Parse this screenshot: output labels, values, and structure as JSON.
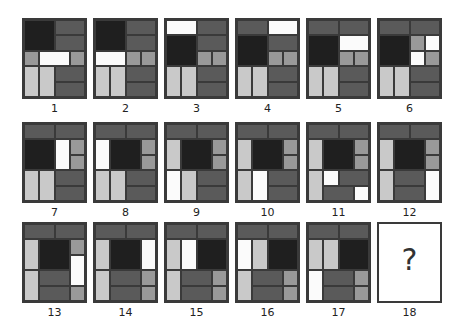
{
  "colors": {
    "K": "#1f1f1f",
    "D": "#5a5a5a",
    "M": "#999999",
    "L": "#c9c9c9",
    "W": "#fbfbfb"
  },
  "tiles": [
    {
      "label": "1",
      "cells": [
        [
          0,
          0,
          2,
          2,
          "K"
        ],
        [
          2,
          0,
          2,
          1,
          "D"
        ],
        [
          2,
          1,
          2,
          1,
          "D"
        ],
        [
          0,
          2,
          1,
          1,
          "M"
        ],
        [
          1,
          2,
          2,
          1,
          "W"
        ],
        [
          3,
          2,
          1,
          1,
          "M"
        ],
        [
          0,
          3,
          1,
          2,
          "L"
        ],
        [
          1,
          3,
          1,
          2,
          "L"
        ],
        [
          2,
          3,
          2,
          1,
          "D"
        ],
        [
          2,
          4,
          2,
          1,
          "D"
        ]
      ]
    },
    {
      "label": "2",
      "cells": [
        [
          0,
          0,
          2,
          2,
          "K"
        ],
        [
          2,
          0,
          2,
          1,
          "D"
        ],
        [
          2,
          1,
          2,
          1,
          "D"
        ],
        [
          0,
          2,
          2,
          1,
          "W"
        ],
        [
          2,
          2,
          1,
          1,
          "M"
        ],
        [
          3,
          2,
          1,
          1,
          "M"
        ],
        [
          0,
          3,
          1,
          2,
          "L"
        ],
        [
          1,
          3,
          1,
          2,
          "L"
        ],
        [
          2,
          3,
          2,
          1,
          "D"
        ],
        [
          2,
          4,
          2,
          1,
          "D"
        ]
      ]
    },
    {
      "label": "3",
      "cells": [
        [
          0,
          0,
          2,
          1,
          "W"
        ],
        [
          2,
          0,
          2,
          1,
          "D"
        ],
        [
          0,
          1,
          2,
          2,
          "K"
        ],
        [
          2,
          1,
          2,
          1,
          "D"
        ],
        [
          2,
          2,
          1,
          1,
          "M"
        ],
        [
          3,
          2,
          1,
          1,
          "M"
        ],
        [
          0,
          3,
          1,
          2,
          "L"
        ],
        [
          1,
          3,
          1,
          2,
          "L"
        ],
        [
          2,
          3,
          2,
          1,
          "D"
        ],
        [
          2,
          4,
          2,
          1,
          "D"
        ]
      ]
    },
    {
      "label": "4",
      "cells": [
        [
          0,
          0,
          2,
          1,
          "D"
        ],
        [
          2,
          0,
          2,
          1,
          "W"
        ],
        [
          0,
          1,
          2,
          2,
          "K"
        ],
        [
          2,
          1,
          2,
          1,
          "D"
        ],
        [
          2,
          2,
          1,
          1,
          "M"
        ],
        [
          3,
          2,
          1,
          1,
          "M"
        ],
        [
          0,
          3,
          1,
          2,
          "L"
        ],
        [
          1,
          3,
          1,
          2,
          "L"
        ],
        [
          2,
          3,
          2,
          1,
          "D"
        ],
        [
          2,
          4,
          2,
          1,
          "D"
        ]
      ]
    },
    {
      "label": "5",
      "cells": [
        [
          0,
          0,
          2,
          1,
          "D"
        ],
        [
          2,
          0,
          2,
          1,
          "D"
        ],
        [
          0,
          1,
          2,
          2,
          "K"
        ],
        [
          2,
          1,
          2,
          1,
          "W"
        ],
        [
          2,
          2,
          1,
          1,
          "M"
        ],
        [
          3,
          2,
          1,
          1,
          "M"
        ],
        [
          0,
          3,
          1,
          2,
          "L"
        ],
        [
          1,
          3,
          1,
          2,
          "L"
        ],
        [
          2,
          3,
          2,
          1,
          "D"
        ],
        [
          2,
          4,
          2,
          1,
          "D"
        ]
      ]
    },
    {
      "label": "6",
      "cells": [
        [
          0,
          0,
          2,
          1,
          "D"
        ],
        [
          2,
          0,
          2,
          1,
          "D"
        ],
        [
          0,
          1,
          2,
          2,
          "K"
        ],
        [
          2,
          1,
          1,
          1,
          "M"
        ],
        [
          3,
          1,
          1,
          1,
          "W"
        ],
        [
          2,
          2,
          1,
          1,
          "W"
        ],
        [
          3,
          2,
          1,
          1,
          "M"
        ],
        [
          0,
          3,
          1,
          2,
          "L"
        ],
        [
          1,
          3,
          1,
          2,
          "L"
        ],
        [
          2,
          3,
          2,
          1,
          "D"
        ],
        [
          2,
          4,
          2,
          1,
          "D"
        ]
      ]
    },
    {
      "label": "7",
      "cells": [
        [
          0,
          0,
          2,
          1,
          "D"
        ],
        [
          2,
          0,
          2,
          1,
          "D"
        ],
        [
          0,
          1,
          2,
          2,
          "K"
        ],
        [
          2,
          1,
          1,
          2,
          "W"
        ],
        [
          3,
          1,
          1,
          1,
          "M"
        ],
        [
          3,
          2,
          1,
          1,
          "M"
        ],
        [
          0,
          3,
          1,
          2,
          "L"
        ],
        [
          1,
          3,
          1,
          2,
          "L"
        ],
        [
          2,
          3,
          2,
          1,
          "D"
        ],
        [
          2,
          4,
          2,
          1,
          "D"
        ]
      ]
    },
    {
      "label": "8",
      "cells": [
        [
          0,
          0,
          2,
          1,
          "D"
        ],
        [
          2,
          0,
          2,
          1,
          "D"
        ],
        [
          0,
          1,
          1,
          2,
          "W"
        ],
        [
          1,
          1,
          2,
          2,
          "K"
        ],
        [
          3,
          1,
          1,
          1,
          "M"
        ],
        [
          3,
          2,
          1,
          1,
          "M"
        ],
        [
          0,
          3,
          1,
          2,
          "L"
        ],
        [
          1,
          3,
          1,
          2,
          "L"
        ],
        [
          2,
          3,
          2,
          1,
          "D"
        ],
        [
          2,
          4,
          2,
          1,
          "D"
        ]
      ]
    },
    {
      "label": "9",
      "cells": [
        [
          0,
          0,
          2,
          1,
          "D"
        ],
        [
          2,
          0,
          2,
          1,
          "D"
        ],
        [
          0,
          1,
          1,
          2,
          "L"
        ],
        [
          1,
          1,
          2,
          2,
          "K"
        ],
        [
          3,
          1,
          1,
          1,
          "M"
        ],
        [
          3,
          2,
          1,
          1,
          "M"
        ],
        [
          0,
          3,
          1,
          2,
          "W"
        ],
        [
          1,
          3,
          1,
          2,
          "L"
        ],
        [
          2,
          3,
          2,
          1,
          "D"
        ],
        [
          2,
          4,
          2,
          1,
          "D"
        ]
      ]
    },
    {
      "label": "10",
      "cells": [
        [
          0,
          0,
          2,
          1,
          "D"
        ],
        [
          2,
          0,
          2,
          1,
          "D"
        ],
        [
          0,
          1,
          1,
          2,
          "L"
        ],
        [
          1,
          1,
          2,
          2,
          "K"
        ],
        [
          3,
          1,
          1,
          1,
          "M"
        ],
        [
          3,
          2,
          1,
          1,
          "M"
        ],
        [
          0,
          3,
          1,
          2,
          "L"
        ],
        [
          1,
          3,
          1,
          2,
          "W"
        ],
        [
          2,
          3,
          2,
          1,
          "D"
        ],
        [
          2,
          4,
          2,
          1,
          "D"
        ]
      ]
    },
    {
      "label": "11",
      "cells": [
        [
          0,
          0,
          2,
          1,
          "D"
        ],
        [
          2,
          0,
          2,
          1,
          "D"
        ],
        [
          0,
          1,
          1,
          2,
          "L"
        ],
        [
          1,
          1,
          2,
          2,
          "K"
        ],
        [
          3,
          1,
          1,
          1,
          "M"
        ],
        [
          3,
          2,
          1,
          1,
          "M"
        ],
        [
          0,
          3,
          1,
          2,
          "L"
        ],
        [
          1,
          3,
          1,
          1,
          "W"
        ],
        [
          2,
          3,
          2,
          1,
          "D"
        ],
        [
          1,
          4,
          2,
          1,
          "D"
        ],
        [
          3,
          4,
          1,
          1,
          "W"
        ]
      ]
    },
    {
      "label": "12",
      "cells": [
        [
          0,
          0,
          2,
          1,
          "D"
        ],
        [
          2,
          0,
          2,
          1,
          "D"
        ],
        [
          0,
          1,
          1,
          2,
          "L"
        ],
        [
          1,
          1,
          2,
          2,
          "K"
        ],
        [
          3,
          1,
          1,
          1,
          "M"
        ],
        [
          3,
          2,
          1,
          1,
          "M"
        ],
        [
          0,
          3,
          1,
          2,
          "L"
        ],
        [
          1,
          3,
          2,
          1,
          "D"
        ],
        [
          1,
          4,
          2,
          1,
          "D"
        ],
        [
          3,
          3,
          1,
          2,
          "W"
        ]
      ]
    },
    {
      "label": "13",
      "cells": [
        [
          0,
          0,
          2,
          1,
          "D"
        ],
        [
          2,
          0,
          2,
          1,
          "D"
        ],
        [
          0,
          1,
          1,
          2,
          "L"
        ],
        [
          1,
          1,
          2,
          2,
          "K"
        ],
        [
          3,
          1,
          1,
          1,
          "M"
        ],
        [
          3,
          2,
          1,
          2,
          "W"
        ],
        [
          0,
          3,
          1,
          2,
          "L"
        ],
        [
          1,
          3,
          2,
          1,
          "D"
        ],
        [
          1,
          4,
          2,
          1,
          "D"
        ],
        [
          3,
          4,
          1,
          1,
          "M"
        ]
      ]
    },
    {
      "label": "14",
      "cells": [
        [
          0,
          0,
          2,
          1,
          "D"
        ],
        [
          2,
          0,
          2,
          1,
          "D"
        ],
        [
          0,
          1,
          1,
          2,
          "L"
        ],
        [
          1,
          1,
          2,
          2,
          "K"
        ],
        [
          3,
          1,
          1,
          2,
          "W"
        ],
        [
          0,
          3,
          1,
          2,
          "L"
        ],
        [
          1,
          3,
          2,
          1,
          "D"
        ],
        [
          3,
          3,
          1,
          1,
          "M"
        ],
        [
          1,
          4,
          2,
          1,
          "D"
        ],
        [
          3,
          4,
          1,
          1,
          "M"
        ]
      ]
    },
    {
      "label": "15",
      "cells": [
        [
          0,
          0,
          2,
          1,
          "D"
        ],
        [
          2,
          0,
          2,
          1,
          "D"
        ],
        [
          0,
          1,
          1,
          2,
          "L"
        ],
        [
          1,
          1,
          1,
          2,
          "W"
        ],
        [
          2,
          1,
          2,
          2,
          "K"
        ],
        [
          0,
          3,
          1,
          2,
          "L"
        ],
        [
          1,
          3,
          2,
          1,
          "D"
        ],
        [
          3,
          3,
          1,
          1,
          "M"
        ],
        [
          1,
          4,
          2,
          1,
          "D"
        ],
        [
          3,
          4,
          1,
          1,
          "M"
        ]
      ]
    },
    {
      "label": "16",
      "cells": [
        [
          0,
          0,
          2,
          1,
          "D"
        ],
        [
          2,
          0,
          2,
          1,
          "D"
        ],
        [
          0,
          1,
          1,
          2,
          "W"
        ],
        [
          1,
          1,
          1,
          2,
          "L"
        ],
        [
          2,
          1,
          2,
          2,
          "K"
        ],
        [
          0,
          3,
          1,
          2,
          "L"
        ],
        [
          1,
          3,
          2,
          1,
          "D"
        ],
        [
          3,
          3,
          1,
          1,
          "M"
        ],
        [
          1,
          4,
          2,
          1,
          "D"
        ],
        [
          3,
          4,
          1,
          1,
          "M"
        ]
      ]
    },
    {
      "label": "17",
      "cells": [
        [
          0,
          0,
          2,
          1,
          "D"
        ],
        [
          2,
          0,
          2,
          1,
          "D"
        ],
        [
          0,
          1,
          1,
          2,
          "L"
        ],
        [
          1,
          1,
          1,
          2,
          "L"
        ],
        [
          2,
          1,
          2,
          2,
          "K"
        ],
        [
          0,
          3,
          1,
          2,
          "W"
        ],
        [
          1,
          3,
          2,
          1,
          "D"
        ],
        [
          3,
          3,
          1,
          1,
          "M"
        ],
        [
          1,
          4,
          2,
          1,
          "D"
        ],
        [
          3,
          4,
          1,
          1,
          "M"
        ]
      ]
    }
  ],
  "answer_tile": {
    "label": "18",
    "symbol": "?"
  }
}
